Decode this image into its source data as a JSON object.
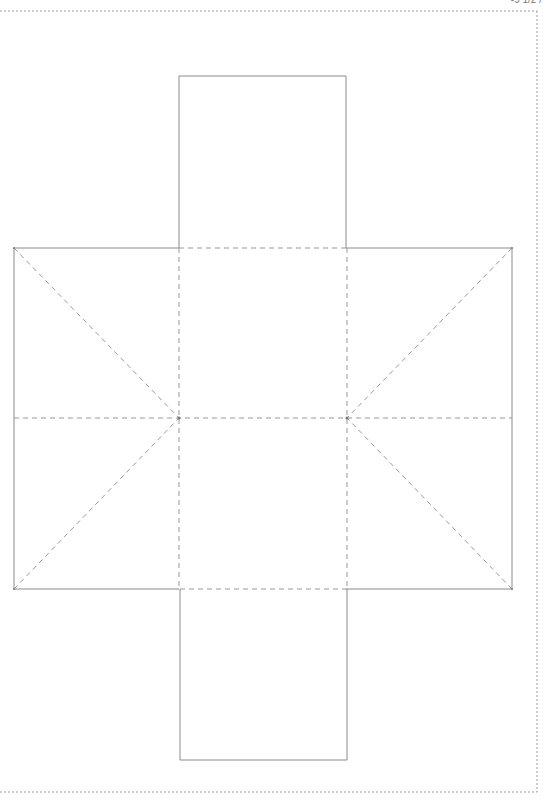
{
  "page": {
    "header_fragment": "-9 1/2 /"
  },
  "diagram": {
    "type": "box-net",
    "colors": {
      "cut_line": "#8a8a8a",
      "fold_line": "#999999",
      "page_border": "#9a9a9a",
      "background": "#ffffff"
    },
    "legend": {
      "cut_line_style": "solid",
      "fold_line_style": "dashed",
      "page_border_style": "dotted"
    },
    "panels": [
      {
        "name": "top-flap",
        "kind": "cut"
      },
      {
        "name": "left-panel",
        "kind": "cut"
      },
      {
        "name": "center-face",
        "kind": "fold"
      },
      {
        "name": "right-panel",
        "kind": "cut"
      },
      {
        "name": "bottom-flap",
        "kind": "cut"
      }
    ]
  }
}
